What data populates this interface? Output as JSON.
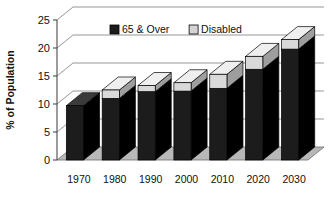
{
  "chart_data": {
    "type": "bar",
    "subtype": "stacked-column-3d",
    "title": "",
    "xlabel": "",
    "ylabel": "% of Population",
    "ylim": [
      0,
      25
    ],
    "yticks": [
      0,
      5,
      10,
      15,
      20,
      25
    ],
    "ytick_labels": [
      "0",
      "5",
      "10",
      "15",
      "20",
      "25"
    ],
    "grid": true,
    "grid_axis": "y",
    "legend_position": "top-center",
    "categories": [
      "1970",
      "1980",
      "1990",
      "2000",
      "2010",
      "2020",
      "2030"
    ],
    "series": [
      {
        "name": "65 & Over",
        "color": "#1c1c1c",
        "values": [
          9.7,
          11.0,
          12.2,
          12.3,
          12.8,
          16.2,
          19.8
        ]
      },
      {
        "name": "Disabled",
        "color": "#d4d4d4",
        "values": [
          0.0,
          1.5,
          1.1,
          1.5,
          2.5,
          2.3,
          1.7
        ]
      }
    ],
    "totals": [
      9.7,
      12.5,
      13.3,
      13.8,
      15.3,
      18.5,
      21.5
    ]
  },
  "legend": {
    "items": [
      {
        "label": "65 & Over",
        "swatch": "#1c1c1c"
      },
      {
        "label": "Disabled",
        "swatch": "#d4d4d4"
      }
    ]
  },
  "axes": {
    "y_title": "% of Population"
  },
  "colors": {
    "bar_dark": "#1c1c1c",
    "bar_dark_side": "#000000",
    "bar_dark_top": "#3a3a3a",
    "bar_light": "#d9d9d9",
    "bar_light_side": "#9e9e9e",
    "bar_light_top": "#efefef",
    "floor": "#b8b8b8",
    "back_wall": "#ffffff",
    "gridline": "#8a8a8a",
    "axis": "#4a4a4a",
    "text": "#111111"
  }
}
